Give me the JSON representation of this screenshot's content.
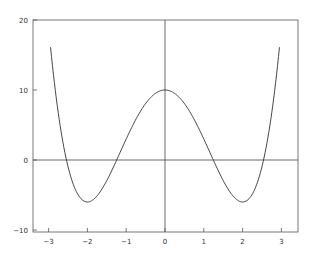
{
  "chart_data": {
    "type": "line",
    "title": "",
    "xlabel": "",
    "ylabel": "",
    "function": "x^4 - 8x^2 + 10",
    "xlim": [
      -3.4,
      3.4
    ],
    "ylim": [
      -10,
      20
    ],
    "grid": false,
    "legend": null,
    "zero_lines": {
      "horizontal_y": 0,
      "vertical_x": 0
    },
    "x_ticks": [
      -3,
      -2,
      -1,
      0,
      1,
      2,
      3
    ],
    "x_tick_labels": [
      "−3",
      "−2",
      "−1",
      "0",
      "1",
      "2",
      "3"
    ],
    "y_ticks": [
      -10,
      0,
      10,
      20
    ],
    "y_tick_labels": [
      "−10",
      "0",
      "10",
      "20"
    ],
    "series": [
      {
        "name": "f(x)",
        "x": [
          -2.95,
          -2.75,
          -2.5,
          -2.25,
          -2.0,
          -1.75,
          -1.5,
          -1.25,
          -1.0,
          -0.75,
          -0.5,
          -0.25,
          0.0,
          0.25,
          0.5,
          0.75,
          1.0,
          1.25,
          1.5,
          1.75,
          2.0,
          2.25,
          2.5,
          2.75,
          2.95
        ],
        "y": [
          16.1,
          6.7,
          -1.06,
          -4.87,
          -6.0,
          -5.12,
          -2.94,
          -0.06,
          3.0,
          5.82,
          8.06,
          9.5,
          10.0,
          9.5,
          8.06,
          5.82,
          3.0,
          -0.06,
          -2.94,
          -5.12,
          -6.0,
          -4.87,
          -1.06,
          6.7,
          16.1
        ]
      }
    ],
    "colors": {
      "line": "#333333",
      "frame": "#555555",
      "background": "#ffffff"
    }
  }
}
